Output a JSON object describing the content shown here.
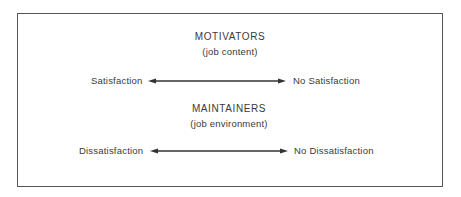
{
  "diagram": {
    "groups": [
      {
        "title": "MOTIVATORS",
        "subtitle": "(job content)",
        "left_label": "Satisfaction",
        "right_label": "No Satisfaction"
      },
      {
        "title": "MAINTAINERS",
        "subtitle": "(job environment)",
        "left_label": "Dissatisfaction",
        "right_label": "No Dissatisfaction"
      }
    ],
    "colors": {
      "line": "#333333",
      "text": "#3a3a3a",
      "border": "#555555"
    }
  }
}
